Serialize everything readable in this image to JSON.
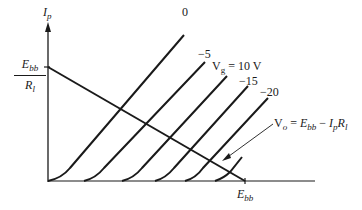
{
  "diagram": {
    "type": "plate characteristic curves with load line",
    "y_axis": {
      "label": "I",
      "label_sub": "p"
    },
    "x_axis": {
      "label": "E",
      "label_sub": "bb"
    },
    "intercept_y": {
      "numerator": "E",
      "numerator_sub": "bb",
      "denominator": "R",
      "denominator_sub": "l"
    },
    "grid_voltage_label": {
      "prefix": "V",
      "prefix_sub": "g",
      "suffix": " = 10 V"
    },
    "curves": [
      {
        "label": "0"
      },
      {
        "label": "−5"
      },
      {
        "label": "−15"
      },
      {
        "label": "−20"
      }
    ],
    "load_line_equation": {
      "lhs": "V",
      "lhs_sub": "o",
      "eq": " = ",
      "t1": "E",
      "t1_sub": "bb",
      "minus": " − ",
      "t2": "I",
      "t2_sub": "p",
      "t3": "R",
      "t3_sub": "l"
    }
  },
  "colors": {
    "ink": "#1a1a1a",
    "background": "#ffffff"
  }
}
